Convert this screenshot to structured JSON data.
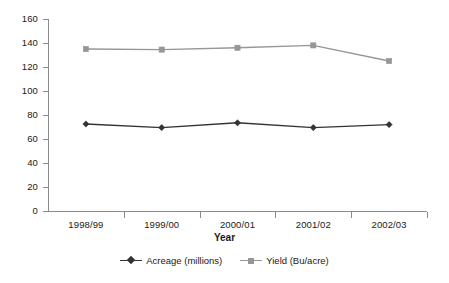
{
  "chart_data": {
    "type": "line",
    "title": "",
    "xlabel": "Year",
    "ylabel": "",
    "categories": [
      "1998/99",
      "1999/00",
      "2000/01",
      "2001/02",
      "2002/03"
    ],
    "series": [
      {
        "name": "Acreage (millions)",
        "values": [
          72.5,
          69.5,
          73.5,
          69.5,
          72
        ],
        "color": "#333333",
        "marker": "diamond"
      },
      {
        "name": "Yield (Bu/acre)",
        "values": [
          135,
          134.5,
          136,
          138,
          125
        ],
        "color": "#969696",
        "marker": "square"
      }
    ],
    "ylim": [
      0,
      160
    ],
    "ytick_step": 20,
    "yticks": [
      "160",
      "140",
      "120",
      "100",
      "80",
      "60",
      "40",
      "20",
      "0"
    ],
    "grid": false,
    "legend_position": "bottom"
  },
  "axis": {
    "axis_color": "#8a8a8a"
  },
  "legend": {
    "items": [
      {
        "label": "Acreage (millions)"
      },
      {
        "label": "Yield (Bu/acre)"
      }
    ]
  }
}
